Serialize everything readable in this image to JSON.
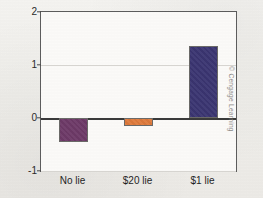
{
  "figure": {
    "credit": "© Cengage Learning",
    "background_color": "#f2f1ee",
    "plot_background_color": "#fbfaf8",
    "frame_color": "#5d5d5d"
  },
  "chart_data": {
    "type": "bar",
    "title": "",
    "xlabel": "",
    "ylabel": "Enjoyment rating",
    "categories": [
      "No lie",
      "$20 lie",
      "$1 lie"
    ],
    "values": [
      -0.45,
      -0.15,
      1.35
    ],
    "bar_colors": [
      "#6e3a68",
      "#e07b3c",
      "#3b3572"
    ],
    "ylim": [
      -1,
      2
    ],
    "yticks": [
      2,
      1,
      0,
      -1
    ],
    "ytick_labels": [
      "2",
      "1",
      "0",
      "-1"
    ],
    "gridlines": [
      1,
      -1
    ],
    "zero_line": 0,
    "grid": true,
    "legend": "none"
  }
}
